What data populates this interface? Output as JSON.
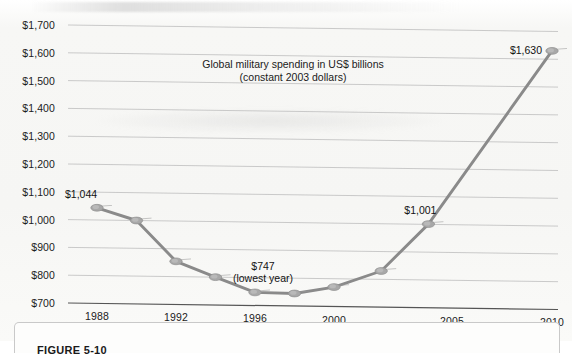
{
  "figure": {
    "caption_label": "FIGURE 5-10"
  },
  "chart_data": {
    "type": "line",
    "title": "Global military spending in US$ billions",
    "subtitle": "(constant 2003 dollars)",
    "xlabel": "",
    "ylabel": "",
    "ylim": [
      700,
      1700
    ],
    "ytick_step": 100,
    "grid": true,
    "legend": false,
    "ytick_labels": [
      "$1,700",
      "$1,600",
      "$1,500",
      "$1,400",
      "$1,300",
      "$1,200",
      "$1,100",
      "$1,000",
      "$900",
      "$800",
      "$700"
    ],
    "ytick_values": [
      1700,
      1600,
      1500,
      1400,
      1300,
      1200,
      1100,
      1000,
      900,
      800,
      700
    ],
    "xtick_labels": [
      "1988",
      "1992",
      "1996",
      "2000",
      "2005",
      "2010"
    ],
    "xtick_values": [
      1988,
      1992,
      1996,
      2000,
      2005,
      2010
    ],
    "x": [
      1988,
      1990,
      1992,
      1994,
      1996,
      1998,
      2000,
      2002,
      2004,
      2010
    ],
    "values": [
      1044,
      1000,
      855,
      800,
      747,
      745,
      770,
      830,
      1001,
      1630
    ],
    "point_labels": [
      {
        "x": 1988,
        "y": 1044,
        "text": "$1,044"
      },
      {
        "x": 1996,
        "y": 747,
        "text": "$747"
      },
      {
        "x": 1996,
        "y": 747,
        "text": "(lowest year)"
      },
      {
        "x": 2004,
        "y": 1001,
        "text": "$1,001"
      },
      {
        "x": 2010,
        "y": 1630,
        "text": "$1,630"
      }
    ],
    "annotations": [
      {
        "name": "first-point-label",
        "text": "$1,044"
      },
      {
        "name": "lowest-value-label",
        "text": "$747"
      },
      {
        "name": "lowest-year-note",
        "text": "(lowest year)"
      },
      {
        "name": "mid-point-label",
        "text": "$1,001"
      },
      {
        "name": "last-point-label",
        "text": "$1,630"
      }
    ],
    "colors": {
      "line": "#8a8a8a",
      "marker": "#a8a8a8",
      "grid": "#c4c4c4",
      "axis": "#555555",
      "text": "#1b1b1b",
      "background": "#f7f7f5"
    }
  }
}
